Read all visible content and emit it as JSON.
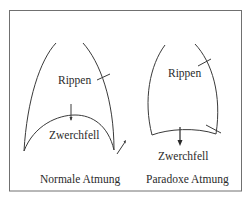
{
  "diagram": {
    "frame_color": "#6e6e6e",
    "line_color": "#3a3a3a",
    "left_panel": {
      "rib_label": "Rippen",
      "diaphragm_label": "Zwerchfell",
      "caption": "Normale Atmung"
    },
    "right_panel": {
      "rib_label": "Rippen",
      "diaphragm_label": "Zwerchfell",
      "caption": "Paradoxe Atmung"
    }
  }
}
